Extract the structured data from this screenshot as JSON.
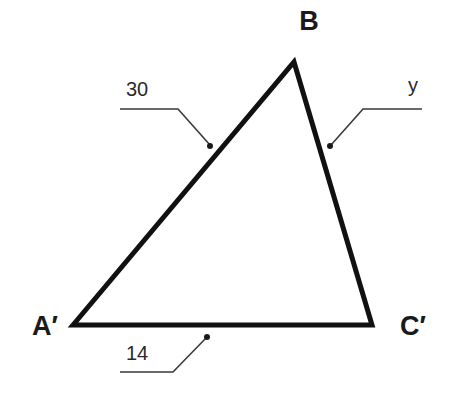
{
  "diagram": {
    "type": "triangle",
    "colors": {
      "stroke": "#111111",
      "text": "#1a1a1a",
      "background": "#ffffff"
    },
    "vertices": {
      "A": {
        "label": "A′",
        "x": 73,
        "y": 325
      },
      "B": {
        "label": "B",
        "x": 294,
        "y": 62
      },
      "C": {
        "label": "C′",
        "x": 372,
        "y": 325
      }
    },
    "sides": {
      "AB": {
        "label": "30"
      },
      "BC": {
        "label": "y"
      },
      "AC": {
        "label": "14"
      }
    }
  }
}
